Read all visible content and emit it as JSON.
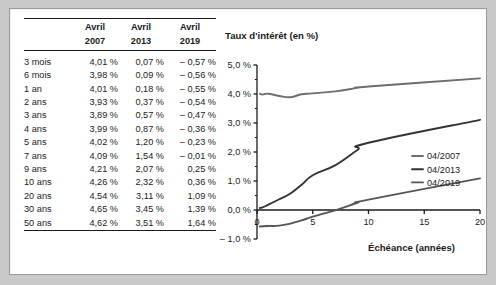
{
  "figure": {
    "frame_color": "#c9c9c9",
    "panel_color": "#ffffff"
  },
  "table": {
    "name": "interest-rate-table",
    "columns": [
      {
        "key": "maturity",
        "header_line1": "",
        "header_line2": ""
      },
      {
        "key": "avril2007",
        "header_line1": "Avril",
        "header_line2": "2007"
      },
      {
        "key": "avril2013",
        "header_line1": "Avril",
        "header_line2": "2013"
      },
      {
        "key": "avril2019",
        "header_line1": "Avril",
        "header_line2": "2019"
      }
    ],
    "rows": [
      {
        "maturity": "3 mois",
        "avril2007": "4,01 %",
        "avril2013": "0,07 %",
        "avril2019": "– 0,57 %"
      },
      {
        "maturity": "6 mois",
        "avril2007": "3,98 %",
        "avril2013": "0,09 %",
        "avril2019": "– 0,56 %"
      },
      {
        "maturity": "1 an",
        "avril2007": "4,01 %",
        "avril2013": "0,18 %",
        "avril2019": "– 0,55 %"
      },
      {
        "maturity": "2 ans",
        "avril2007": "3,93 %",
        "avril2013": "0,37 %",
        "avril2019": "– 0,54 %"
      },
      {
        "maturity": "3 ans",
        "avril2007": "3,89 %",
        "avril2013": "0,57 %",
        "avril2019": "– 0,47 %"
      },
      {
        "maturity": "4 ans",
        "avril2007": "3,99 %",
        "avril2013": "0,87 %",
        "avril2019": "– 0,36 %"
      },
      {
        "maturity": "5 ans",
        "avril2007": "4,02 %",
        "avril2013": "1,20 %",
        "avril2019": "– 0,23 %"
      },
      {
        "maturity": "7 ans",
        "avril2007": "4,09 %",
        "avril2013": "1,54 %",
        "avril2019": "– 0,01 %"
      },
      {
        "maturity": "9 ans",
        "avril2007": "4,21 %",
        "avril2013": "2,07 %",
        "avril2019": "0,25 %"
      },
      {
        "maturity": "10 ans",
        "avril2007": "4,26 %",
        "avril2013": "2,32 %",
        "avril2019": "0,36 %"
      },
      {
        "maturity": "20 ans",
        "avril2007": "4,54 %",
        "avril2013": "3,11 %",
        "avril2019": "1,09 %"
      },
      {
        "maturity": "30 ans",
        "avril2007": "4,65 %",
        "avril2013": "3,45 %",
        "avril2019": "1,39 %"
      },
      {
        "maturity": "50 ans",
        "avril2007": "4,62 %",
        "avril2013": "3,51 %",
        "avril2019": "1,64 %"
      }
    ]
  },
  "chart_data": {
    "type": "line",
    "title": "Taux d'intérêt (en %)",
    "xlabel": "Échéance (années)",
    "ylabel": "Taux d'intérêt (en %)",
    "xlim": [
      0,
      20
    ],
    "ylim": [
      -1.0,
      5.0
    ],
    "xticks": [
      0,
      5,
      10,
      15,
      20
    ],
    "xtick_labels": [
      "0",
      "5",
      "10",
      "15",
      "20"
    ],
    "yticks": [
      -1.0,
      0.0,
      1.0,
      2.0,
      3.0,
      4.0,
      5.0
    ],
    "ytick_labels": [
      "– 1,0 %",
      "0,0 %",
      "1,0 %",
      "2,0 %",
      "3,0 %",
      "4,0 %",
      "5,0 %"
    ],
    "grid": false,
    "legend_position": "center-right",
    "x": [
      0.25,
      0.5,
      1,
      2,
      3,
      4,
      5,
      7,
      9,
      10,
      20
    ],
    "series": [
      {
        "name": "04/2007",
        "color": "#6e6e6e",
        "values": [
          4.01,
          3.98,
          4.01,
          3.93,
          3.89,
          3.99,
          4.02,
          4.09,
          4.21,
          4.26,
          4.54
        ]
      },
      {
        "name": "04/2013",
        "color": "#333333",
        "values": [
          0.07,
          0.09,
          0.18,
          0.37,
          0.57,
          0.87,
          1.2,
          1.54,
          2.07,
          2.32,
          3.11
        ]
      },
      {
        "name": "04/2019",
        "color": "#555555",
        "values": [
          -0.57,
          -0.56,
          -0.55,
          -0.54,
          -0.47,
          -0.36,
          -0.23,
          -0.01,
          0.25,
          0.36,
          1.09
        ]
      }
    ]
  }
}
